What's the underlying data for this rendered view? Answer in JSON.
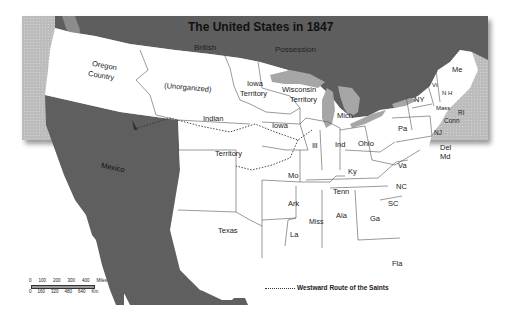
{
  "map": {
    "title": "The United States in 1847",
    "colors": {
      "ocean": "#bdbdbd",
      "foreign_land": "#5f5f5f",
      "us_land": "#ffffff",
      "lakes": "#a8a8a8",
      "borders": "#555555",
      "route": "#333333"
    },
    "regions": {
      "british_possession": [
        "British",
        "Possession"
      ],
      "oregon": [
        "Oregon",
        "Country"
      ],
      "unorganized": "(Unorganized)",
      "iowa_territory": [
        "Iowa",
        "Territory"
      ],
      "wisconsin_territory": [
        "Wisconsin",
        "Territory"
      ],
      "indian_territory": [
        "Indian",
        "Territory"
      ],
      "mexico": "Mexico",
      "texas": "Texas",
      "states": {
        "me": "Me",
        "vt": "Vt",
        "nh": "N H",
        "mass": "Mass",
        "ri": "RI",
        "conn": "Conn",
        "ny": "NY",
        "nj": "NJ",
        "pa": "Pa",
        "del": "Del",
        "md": "Md",
        "va": "Va",
        "nc": "NC",
        "sc": "SC",
        "ga": "Ga",
        "fla": "Fla",
        "ala": "Ala",
        "miss": "Miss",
        "la": "La",
        "ark": "Ark",
        "tenn": "Tenn",
        "ky": "Ky",
        "ohio": "Ohio",
        "ind": "Ind",
        "ill": "Ill",
        "mich": "Mich",
        "iowa": "Iowa",
        "mo": "Mo"
      }
    },
    "legend": {
      "route_label": "Westward Route of the Saints"
    },
    "scale": {
      "miles_ticks": [
        "0",
        "100",
        "200",
        "300",
        "400"
      ],
      "miles_unit": "Miles",
      "km_ticks": [
        "0",
        "160",
        "320",
        "480",
        "640"
      ],
      "km_unit": "Km"
    }
  }
}
